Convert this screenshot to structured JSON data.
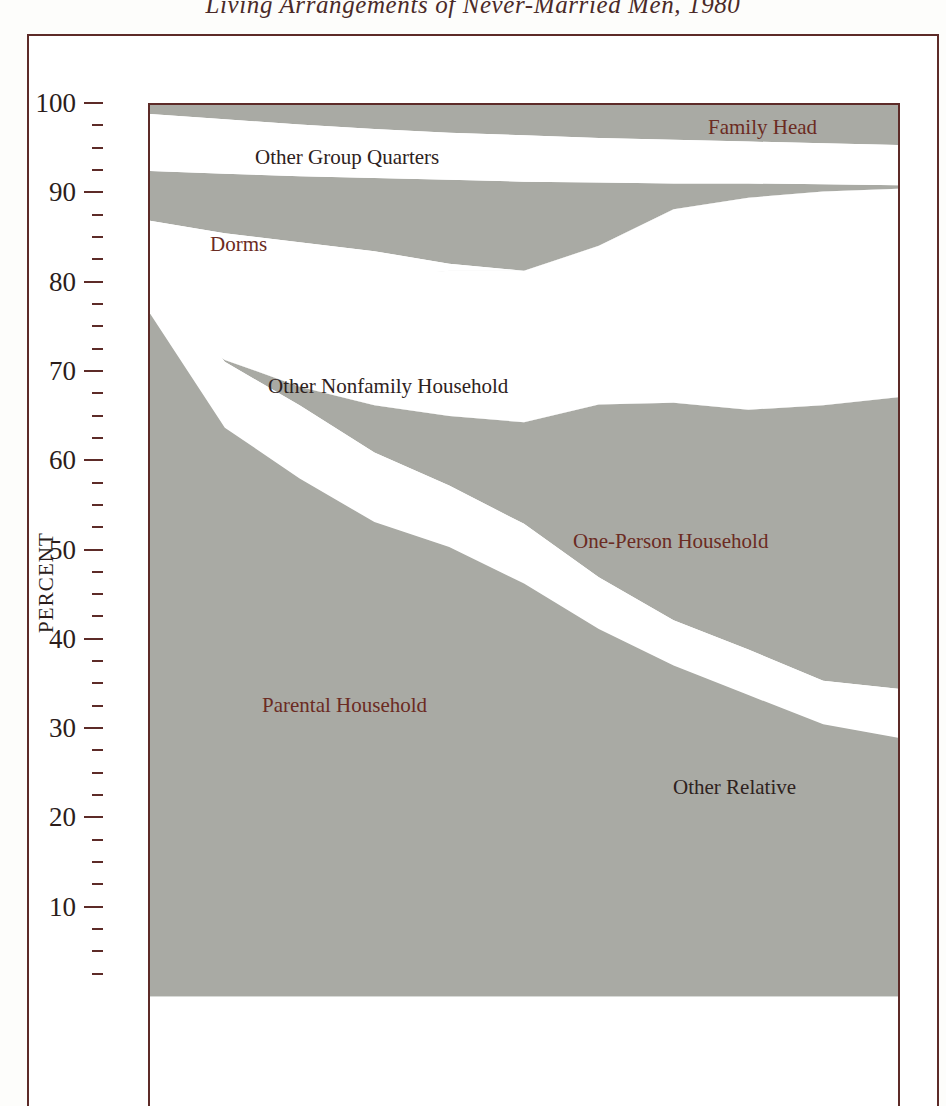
{
  "title": "Living Arrangements of Never-Married Men, 1980",
  "axis": {
    "y_title": "PERCENT",
    "major_labels": [
      "100",
      "90",
      "80",
      "70",
      "60",
      "50",
      "40",
      "30",
      "20",
      "10"
    ]
  },
  "labels": {
    "family_head": "Family Head",
    "other_group_quarters": "Other Group Quarters",
    "dorms": "Dorms",
    "other_nonfamily_household": "Other Nonfamily Household",
    "one_person_household": "One-Person Household",
    "parental_household": "Parental Household",
    "other_relative": "Other Relative"
  },
  "colors": {
    "band_fill": "#a9aaa4",
    "gap_fill": "#ffffff",
    "frame": "#5d2b28",
    "label_red": "#6b2b22",
    "label_dark": "#2e2220",
    "page": "#fdfdfb"
  },
  "chart_data": {
    "type": "area",
    "title": "Living Arrangements of Never-Married Men, 1980",
    "xlabel": "",
    "ylabel": "PERCENT",
    "ylim": [
      0,
      100
    ],
    "grid": false,
    "legend": "inline-annotations",
    "stacking": "cumulative-from-top",
    "note": "Stacked-band chart; shaded bands are categories separated by white gaps. X axis runs left-to-right across age groups (labels cropped below image edge).",
    "x": [
      0,
      1,
      2,
      3,
      4,
      5,
      6,
      7,
      8,
      9,
      10
    ],
    "boundaries_percent": {
      "top": [
        100,
        100,
        100,
        100,
        100,
        100,
        100,
        100,
        100,
        100,
        100
      ],
      "family_head_lower": [
        99.0,
        98.4,
        97.8,
        97.3,
        96.9,
        96.6,
        96.3,
        96.1,
        95.9,
        95.7,
        95.5
      ],
      "other_group_quarters_upper": [
        92.6,
        92.3,
        92.0,
        91.8,
        91.6,
        91.4,
        91.3,
        91.2,
        91.2,
        91.1,
        91.0
      ],
      "other_group_quarters_lower": [
        87.0,
        85.6,
        84.6,
        83.6,
        82.2,
        81.4,
        84.2,
        88.3,
        89.6,
        90.3,
        90.6
      ],
      "dorms_lower": [
        80.8,
        79.5,
        79.8,
        80.6,
        81.4,
        81.4,
        84.2,
        88.3,
        89.6,
        90.3,
        90.6
      ],
      "other_nonfamily_upper": [
        82.0,
        80.8,
        80.4,
        80.9,
        81.4,
        81.4,
        84.2,
        88.3,
        89.6,
        90.3,
        90.6
      ],
      "other_nonfamily_lower": [
        76.6,
        71.4,
        68.4,
        66.3,
        65.1,
        64.4,
        66.4,
        66.6,
        65.8,
        66.3,
        67.2
      ],
      "one_person_upper": [
        76.6,
        71.4,
        68.4,
        66.3,
        65.1,
        64.4,
        66.4,
        66.6,
        65.8,
        66.3,
        67.2
      ],
      "one_person_lower": [
        80.5,
        68.3,
        63.6,
        58.9,
        55.6,
        51.4,
        45.6,
        41.0,
        37.7,
        34.2,
        33.4
      ],
      "parental_upper": [
        82.2,
        71.2,
        66.3,
        61.0,
        57.3,
        53.0,
        47.0,
        42.2,
        38.9,
        35.4,
        34.5
      ],
      "other_relative_lower": [
        76.6,
        63.8,
        58.1,
        53.2,
        50.4,
        46.3,
        41.2,
        37.1,
        33.8,
        30.5,
        29.0
      ]
    },
    "series": [
      {
        "name": "Family Head",
        "label_color": "#6b2b22"
      },
      {
        "name": "Other Group Quarters",
        "label_color": "#2e2220"
      },
      {
        "name": "Dorms",
        "label_color": "#6b2b22"
      },
      {
        "name": "Other Nonfamily Household",
        "label_color": "#2e2220"
      },
      {
        "name": "One-Person Household",
        "label_color": "#6b2b22"
      },
      {
        "name": "Parental Household",
        "label_color": "#6b2b22"
      },
      {
        "name": "Other Relative",
        "label_color": "#2e2220"
      }
    ]
  }
}
